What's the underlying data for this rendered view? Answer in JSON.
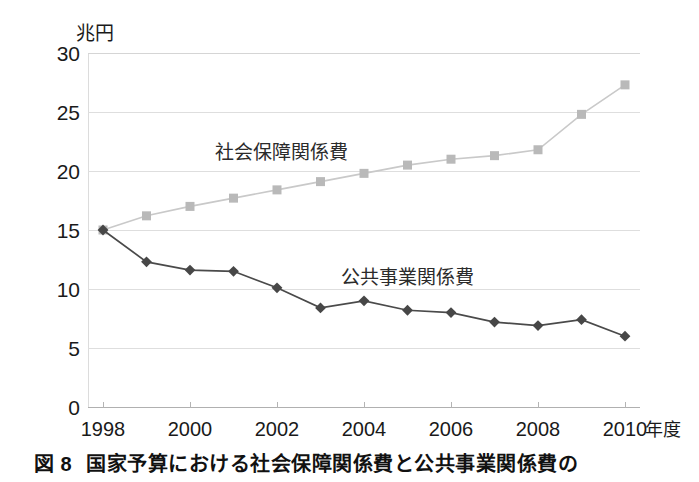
{
  "figure": {
    "caption_number": "図 8",
    "caption_text": "国家予算における社会保障関係費と公共事業関係費の"
  },
  "axes": {
    "y_unit_label": "兆円",
    "x_unit_label": "年度",
    "y_tick_labels": [
      "30",
      "25",
      "20",
      "15",
      "10",
      "5",
      "0"
    ],
    "x_tick_labels": [
      "1998",
      "2000",
      "2002",
      "2004",
      "2006",
      "2008",
      "2010"
    ]
  },
  "series_labels": {
    "social_security": "社会保障関係費",
    "public_works": "公共事業関係費"
  },
  "colors": {
    "social_security_line": "#c9c9c9",
    "social_security_marker": "#b9b9b9",
    "public_works_line": "#4a4a4a",
    "public_works_marker": "#474747",
    "grid": "#dedede",
    "axis": "#b0b0b0",
    "text": "#1a1a1a"
  },
  "chart_data": {
    "type": "line",
    "title": "国家予算における社会保障関係費と公共事業関係費の",
    "xlabel": "年度",
    "ylabel": "兆円",
    "x": [
      1998,
      1999,
      2000,
      2001,
      2002,
      2003,
      2004,
      2005,
      2006,
      2007,
      2008,
      2009,
      2010
    ],
    "xlim": [
      1998,
      2010
    ],
    "ylim": [
      0,
      30
    ],
    "yticks": [
      0,
      5,
      10,
      15,
      20,
      25,
      30
    ],
    "xticks": [
      1998,
      2000,
      2002,
      2004,
      2006,
      2008,
      2010
    ],
    "grid": true,
    "legend": "inline-labels",
    "series": [
      {
        "name": "社会保障関係費",
        "marker": "square",
        "color": "#b9b9b9",
        "values": [
          15.0,
          16.2,
          17.0,
          17.7,
          18.4,
          19.1,
          19.8,
          20.5,
          21.0,
          21.3,
          21.8,
          24.8,
          27.3
        ]
      },
      {
        "name": "公共事業関係費",
        "marker": "diamond",
        "color": "#474747",
        "values": [
          15.0,
          12.3,
          11.6,
          11.5,
          10.1,
          8.4,
          9.0,
          8.2,
          8.0,
          7.2,
          6.9,
          7.4,
          6.0
        ]
      }
    ]
  }
}
